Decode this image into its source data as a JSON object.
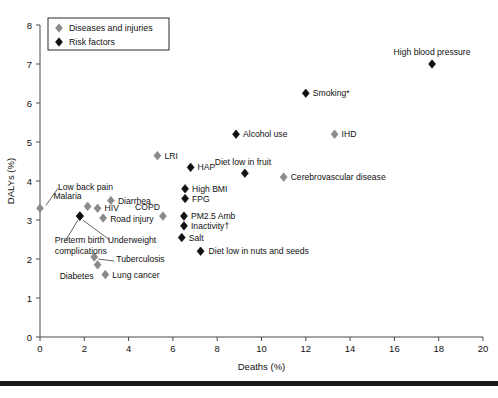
{
  "chart_data": {
    "type": "scatter",
    "title": "",
    "xlabel": "Deaths (%)",
    "ylabel": "DALYs (%)",
    "xlim": [
      0,
      20
    ],
    "ylim": [
      0,
      8
    ],
    "xticks": [
      0,
      2,
      4,
      6,
      8,
      10,
      12,
      14,
      16,
      18,
      20
    ],
    "yticks": [
      0,
      1,
      2,
      3,
      4,
      5,
      6,
      7,
      8
    ],
    "grid": false,
    "legend_position": "top-left",
    "series": [
      {
        "name": "Diseases and injuries",
        "marker": "diamond",
        "color": "#8a8a8a",
        "points": [
          {
            "label": "Low back pain",
            "x": 0.0,
            "y": 3.3,
            "label_pos": "leader-up-right"
          },
          {
            "label": "Malaria",
            "x": 2.15,
            "y": 3.35,
            "label_pos": "left"
          },
          {
            "label": "Diarrhea",
            "x": 3.2,
            "y": 3.5,
            "label_pos": "right"
          },
          {
            "label": "HIV",
            "x": 2.6,
            "y": 3.3,
            "label_pos": "right"
          },
          {
            "label": "Road injury",
            "x": 2.85,
            "y": 3.05,
            "label_pos": "right"
          },
          {
            "label": "COPD",
            "x": 5.55,
            "y": 3.1,
            "label_pos": "above-left"
          },
          {
            "label": "Tuberculosis",
            "x": 2.45,
            "y": 2.05,
            "label_pos": "leader-right"
          },
          {
            "label": "Diabetes",
            "x": 2.6,
            "y": 1.85,
            "label_pos": "below-left"
          },
          {
            "label": "Lung cancer",
            "x": 2.95,
            "y": 1.6,
            "label_pos": "right"
          },
          {
            "label": "LRI",
            "x": 5.3,
            "y": 4.65,
            "label_pos": "right"
          },
          {
            "label": "IHD",
            "x": 13.3,
            "y": 5.2,
            "label_pos": "right"
          },
          {
            "label": "Cerebrovascular disease",
            "x": 11.0,
            "y": 4.1,
            "label_pos": "right"
          }
        ]
      },
      {
        "name": "Risk factors",
        "marker": "diamond",
        "color": "#111111",
        "points": [
          {
            "label": "Preterm birth complications",
            "x": 1.8,
            "y": 3.1,
            "label_pos": "leader-below-left"
          },
          {
            "label": "Underweight",
            "x": 1.8,
            "y": 3.1,
            "label_pos": "leader-below-right"
          },
          {
            "label": "HAP",
            "x": 6.8,
            "y": 4.35,
            "label_pos": "right"
          },
          {
            "label": "High BMI",
            "x": 6.55,
            "y": 3.8,
            "label_pos": "right"
          },
          {
            "label": "FPG",
            "x": 6.55,
            "y": 3.55,
            "label_pos": "right"
          },
          {
            "label": "PM2.5 Amb",
            "x": 6.5,
            "y": 3.1,
            "label_pos": "right"
          },
          {
            "label": "Inactivity†",
            "x": 6.5,
            "y": 2.85,
            "label_pos": "right"
          },
          {
            "label": "Salt",
            "x": 6.4,
            "y": 2.55,
            "label_pos": "right"
          },
          {
            "label": "Diet low in nuts and seeds",
            "x": 7.25,
            "y": 2.2,
            "label_pos": "right"
          },
          {
            "label": "Alcohol use",
            "x": 8.85,
            "y": 5.2,
            "label_pos": "right"
          },
          {
            "label": "Diet low in fruit",
            "x": 9.25,
            "y": 4.2,
            "label_pos": "above"
          },
          {
            "label": "Smoking*",
            "x": 12.0,
            "y": 6.25,
            "label_pos": "right"
          },
          {
            "label": "High blood pressure",
            "x": 17.7,
            "y": 7.0,
            "label_pos": "above"
          }
        ]
      }
    ]
  },
  "legend": {
    "entries": [
      {
        "label": "Diseases and injuries",
        "color": "#8a8a8a"
      },
      {
        "label": "Risk factors",
        "color": "#111111"
      }
    ]
  },
  "axes": {
    "x_title": "Deaths (%)",
    "y_title": "DALYs (%)",
    "x_tick_labels": [
      "0",
      "2",
      "4",
      "6",
      "8",
      "10",
      "12",
      "14",
      "16",
      "18",
      "20"
    ],
    "y_tick_labels": [
      "0",
      "1",
      "2",
      "3",
      "4",
      "5",
      "6",
      "7",
      "8"
    ]
  }
}
